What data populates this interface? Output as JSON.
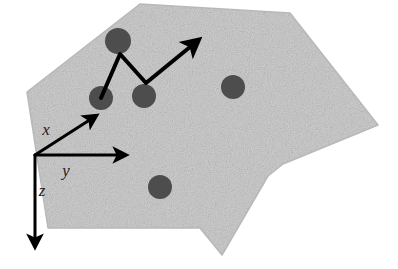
{
  "figure": {
    "background_color": "#ffffff"
  },
  "surface": {
    "name": "rough-surface-patch",
    "fill_color": "#cfcfcf",
    "speckle_color": "#b8b8b8",
    "polygon_points": "140,4 290,13 378,125 283,164 268,176 222,255 200,228 48,228 27,92",
    "description": "irregular light gray speckled polygon representing a surface"
  },
  "particles": {
    "name": "defect-sites",
    "fill_color": "#4d4d4d",
    "items": [
      {
        "id": "particle-top",
        "cx": 118,
        "cy": 41,
        "r": 13
      },
      {
        "id": "particle-left",
        "cx": 101,
        "cy": 98,
        "r": 12
      },
      {
        "id": "particle-middle",
        "cx": 144,
        "cy": 96,
        "r": 12
      },
      {
        "id": "particle-right",
        "cx": 233,
        "cy": 87,
        "r": 12
      },
      {
        "id": "particle-bottom",
        "cx": 160,
        "cy": 187,
        "r": 12
      }
    ]
  },
  "path": {
    "name": "hopping-trajectory",
    "stroke_color": "#000000",
    "stroke_width": 4,
    "points": "101,98 120,54 146,83 190,47",
    "arrow_tip": {
      "x": 194,
      "y": 44
    },
    "description": "zigzag arrow path from left particle up to top particle, down to middle particle, then up-right"
  },
  "axes": {
    "name": "coordinate-frame",
    "origin": {
      "x": 35,
      "y": 155
    },
    "stroke_color": "#000000",
    "stroke_width": 3,
    "items": [
      {
        "id": "axis-x",
        "label": "x",
        "tip": {
          "x": 88,
          "y": 121
        },
        "label_pos": {
          "x": 46,
          "y": 135
        }
      },
      {
        "id": "axis-y",
        "label": "y",
        "tip": {
          "x": 116,
          "y": 155
        },
        "label_pos": {
          "x": 66,
          "y": 176
        }
      },
      {
        "id": "axis-z",
        "label": "z",
        "tip": {
          "x": 35,
          "y": 237
        },
        "label_pos": {
          "x": 42,
          "y": 196
        }
      }
    ]
  }
}
